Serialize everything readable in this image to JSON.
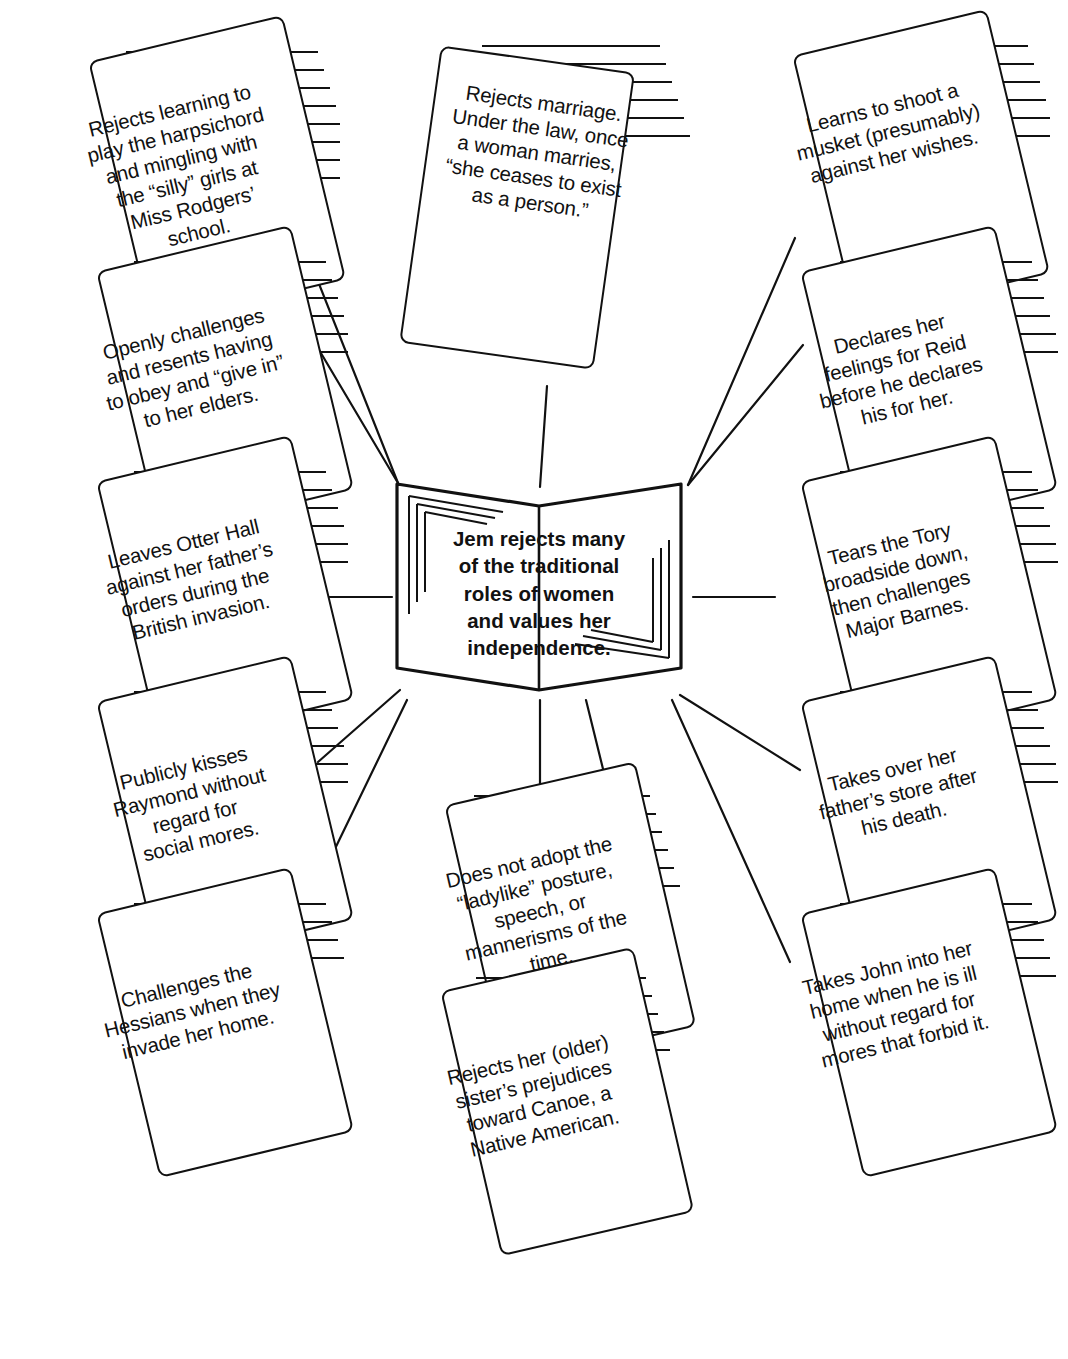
{
  "diagram": {
    "type": "idea-web",
    "center": {
      "label": "Jem rejects many\nof the traditional\nroles of women\nand values her\nindependence.",
      "shape": "open-book"
    },
    "ink_color": "#111111",
    "background_color": "#ffffff",
    "nodes": [
      {
        "id": "harpsichord",
        "text": "Rejects learning to\nplay the harpsichord\nand mingling with\nthe “silly” girls at\nMiss Rodgers’\nschool.",
        "column": "left"
      },
      {
        "id": "obey-elders",
        "text": "Openly challenges\nand resents having\nto obey and “give in”\nto her elders.",
        "column": "left"
      },
      {
        "id": "otter-hall",
        "text": "Leaves Otter Hall\nagainst her father’s\norders during the\nBritish invasion.",
        "column": "left"
      },
      {
        "id": "kisses-raymond",
        "text": "Publicly kisses\nRaymond without\nregard for\nsocial mores.",
        "column": "left"
      },
      {
        "id": "hessians",
        "text": "Challenges the\nHessians when they\ninvade her home.",
        "column": "left"
      },
      {
        "id": "marriage",
        "text": "Rejects marriage.\nUnder the law, once\na woman marries,\n“she ceases to exist\nas a person.”",
        "column": "top-center"
      },
      {
        "id": "ladylike",
        "text": "Does not adopt the\n“ladylike” posture,\nspeech, or\nmannerisms of the\ntime.",
        "column": "bottom-center"
      },
      {
        "id": "canoe",
        "text": "Rejects her (older)\nsister’s prejudices\ntoward Canoe, a\nNative American.",
        "column": "bottom-center"
      },
      {
        "id": "musket",
        "text": "Learns to shoot a\nmusket (presumably)\nagainst her wishes.",
        "column": "right"
      },
      {
        "id": "reid",
        "text": "Declares her\nfeelings for Reid\nbefore he declares\nhis for her.",
        "column": "right"
      },
      {
        "id": "tory-broadside",
        "text": "Tears the Tory\nbroadside down,\nthen challenges\nMajor Barnes.",
        "column": "right"
      },
      {
        "id": "fathers-store",
        "text": "Takes over her\nfather’s store after\nhis death.",
        "column": "right"
      },
      {
        "id": "john-ill",
        "text": "Takes John into her\nhome when he is ill\nwithout regard for\nmores that forbid it.",
        "column": "right"
      }
    ]
  }
}
